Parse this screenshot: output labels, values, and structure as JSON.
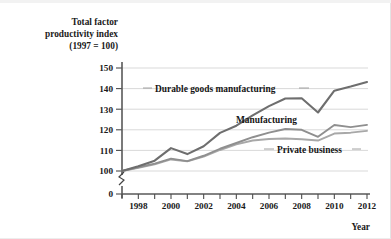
{
  "chart_data": {
    "type": "line",
    "title": "",
    "ylabel": "Total factor productivity index (1997 = 100)",
    "ylabel_lines": [
      "Total factor",
      "productivity index",
      "(1997 = 100)"
    ],
    "xlabel": "Year",
    "x": [
      1997,
      1998,
      1999,
      2000,
      2001,
      2002,
      2003,
      2004,
      2005,
      2006,
      2007,
      2008,
      2009,
      2010,
      2011,
      2012
    ],
    "xtick_labels": [
      "1998",
      "2000",
      "2002",
      "2004",
      "2006",
      "2008",
      "2010",
      "2012"
    ],
    "xtick_values": [
      1998,
      2000,
      2002,
      2004,
      2006,
      2008,
      2010,
      2012
    ],
    "xlim": [
      1997,
      2012.6
    ],
    "ytick_labels": [
      "0",
      "100",
      "110",
      "120",
      "130",
      "140",
      "150"
    ],
    "ytick_values": [
      0,
      100,
      110,
      120,
      130,
      140,
      150
    ],
    "ylim": [
      100,
      152
    ],
    "y_axis_break": true,
    "y_axis_break_note": "axis broken between 0 and 100",
    "grid": "horizontal",
    "legend_position": "inline-labels",
    "series": [
      {
        "name": "Durable goods manufacturing",
        "color": "#6e6e6e",
        "width": 2.1,
        "values": [
          100.0,
          102.3,
          105.0,
          111.1,
          108.2,
          112.0,
          118.5,
          122.0,
          127.0,
          131.5,
          135.2,
          135.3,
          128.4,
          139.0,
          141.0,
          143.2
        ]
      },
      {
        "name": "Manufacturing",
        "color": "#8f8f8f",
        "width": 1.9,
        "values": [
          100.0,
          101.8,
          103.6,
          106.0,
          104.8,
          107.4,
          110.8,
          113.6,
          116.4,
          118.6,
          120.4,
          120.0,
          116.6,
          122.3,
          121.3,
          122.4
        ]
      },
      {
        "name": "Private business",
        "color": "#a8a8a8",
        "width": 1.9,
        "values": [
          100.0,
          101.5,
          103.2,
          105.6,
          104.7,
          107.0,
          110.2,
          112.9,
          114.8,
          115.5,
          115.8,
          115.4,
          114.8,
          118.2,
          118.6,
          119.5
        ]
      }
    ],
    "annotations": [
      {
        "label": "Durable goods manufacturing",
        "x_px": 149,
        "y_px": 91,
        "leader_left": true,
        "leader_right": true
      },
      {
        "label": "Manufacturing",
        "x_px": 236,
        "y_px": 122,
        "leader_left": false,
        "leader_right": false
      },
      {
        "label": "Private business",
        "x_px": 271,
        "y_px": 152,
        "leader_left": true,
        "leader_right": true
      }
    ]
  }
}
